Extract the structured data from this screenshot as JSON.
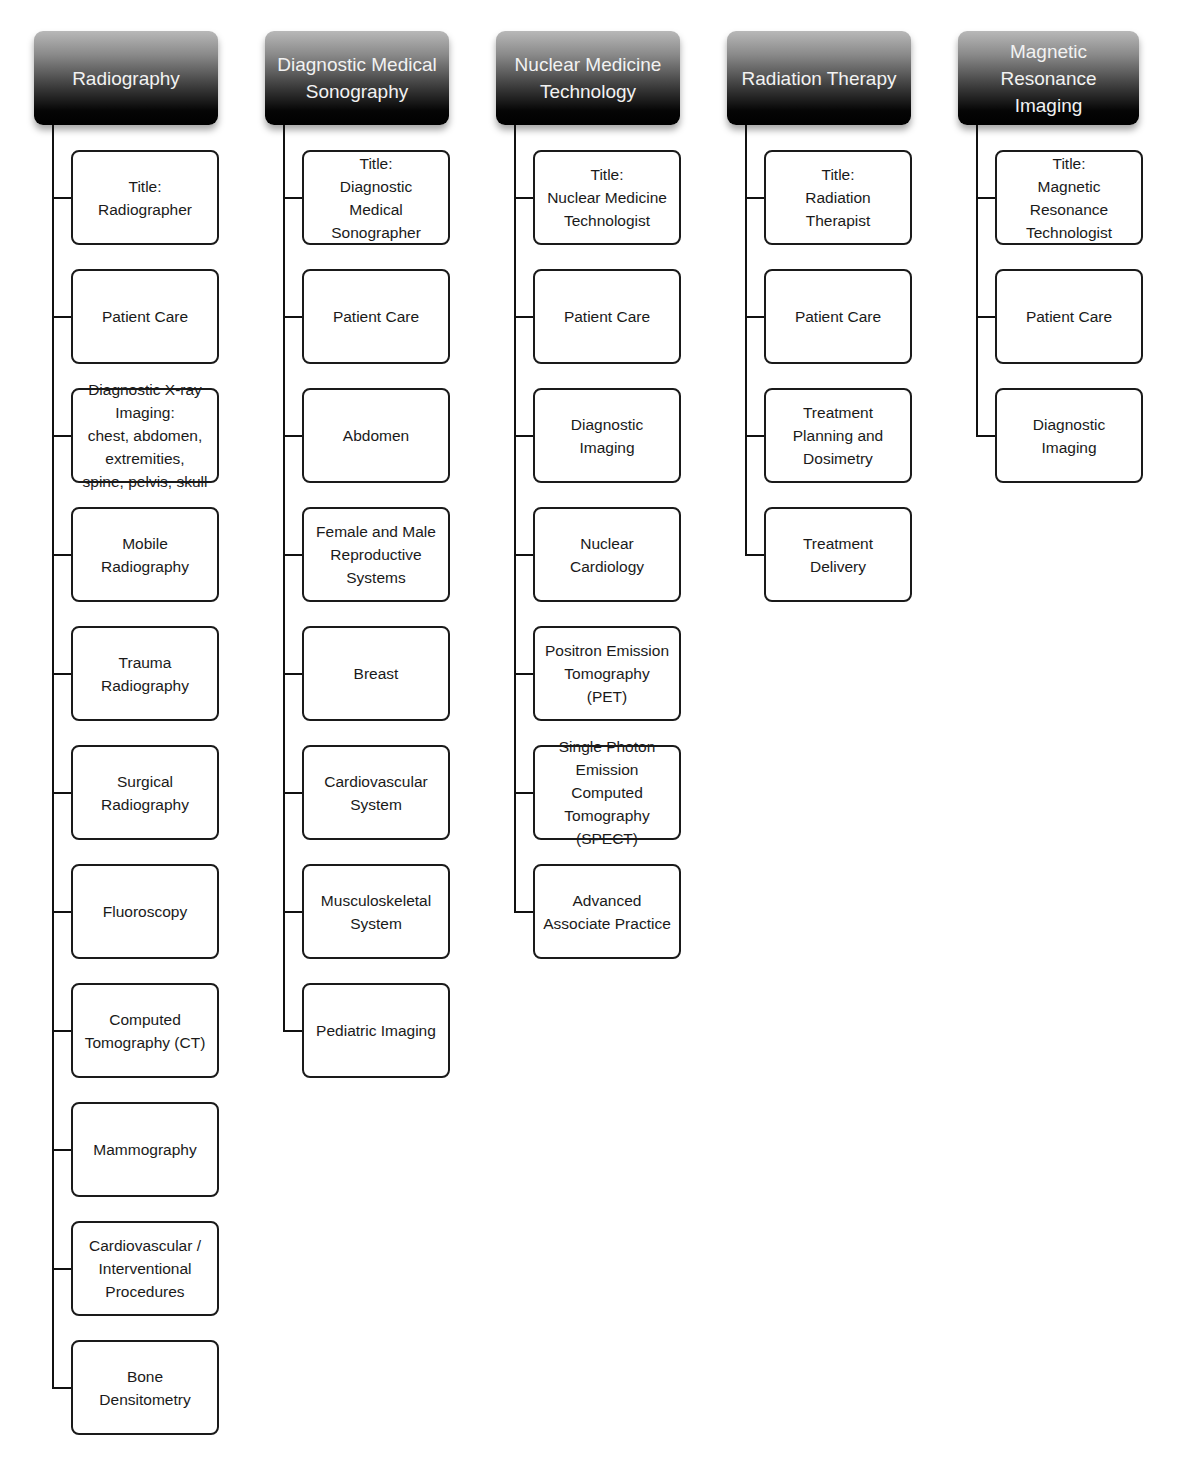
{
  "diagram": {
    "type": "hierarchy",
    "columns": [
      {
        "header": "Radiography",
        "items": [
          "Title:\nRadiographer",
          "Patient Care",
          "Diagnostic X-ray\nImaging:\nchest, abdomen,\nextremities,\nspine, pelvis, skull",
          "Mobile\nRadiography",
          "Trauma\nRadiography",
          "Surgical\nRadiography",
          "Fluoroscopy",
          "Computed\nTomography (CT)",
          "Mammography",
          "Cardiovascular /\nInterventional\nProcedures",
          "Bone\nDensitometry"
        ]
      },
      {
        "header": "Diagnostic Medical Sonography",
        "items": [
          "Title:\nDiagnostic\nMedical\nSonographer",
          "Patient Care",
          "Abdomen",
          "Female and Male\nReproductive\nSystems",
          "Breast",
          "Cardiovascular\nSystem",
          "Musculoskeletal\nSystem",
          "Pediatric Imaging"
        ]
      },
      {
        "header": "Nuclear Medicine Technology",
        "items": [
          "Title:\nNuclear Medicine\nTechnologist",
          "Patient Care",
          "Diagnostic\nImaging",
          "Nuclear\nCardiology",
          "Positron Emission\nTomography\n(PET)",
          "Single Photon\nEmission\nComputed\nTomography\n(SPECT)",
          "Advanced\nAssociate Practice"
        ]
      },
      {
        "header": "Radiation Therapy",
        "items": [
          "Title:\nRadiation\nTherapist",
          "Patient Care",
          "Treatment\nPlanning and\nDosimetry",
          "Treatment\nDelivery"
        ]
      },
      {
        "header": "Magnetic Resonance Imaging",
        "items": [
          "Title:\nMagnetic\nResonance\nTechnologist",
          "Patient Care",
          "Diagnostic\nImaging"
        ]
      }
    ]
  },
  "layout": {
    "header_x": [
      34,
      265,
      496,
      727,
      958
    ],
    "header_w": [
      184,
      184,
      184,
      184,
      181
    ],
    "header_text": [
      "Radiography",
      "Diagnostic Medical\nSonography",
      "Nuclear Medicine\nTechnology",
      "Radiation Therapy",
      "Magnetic\nResonance\nImaging"
    ]
  }
}
